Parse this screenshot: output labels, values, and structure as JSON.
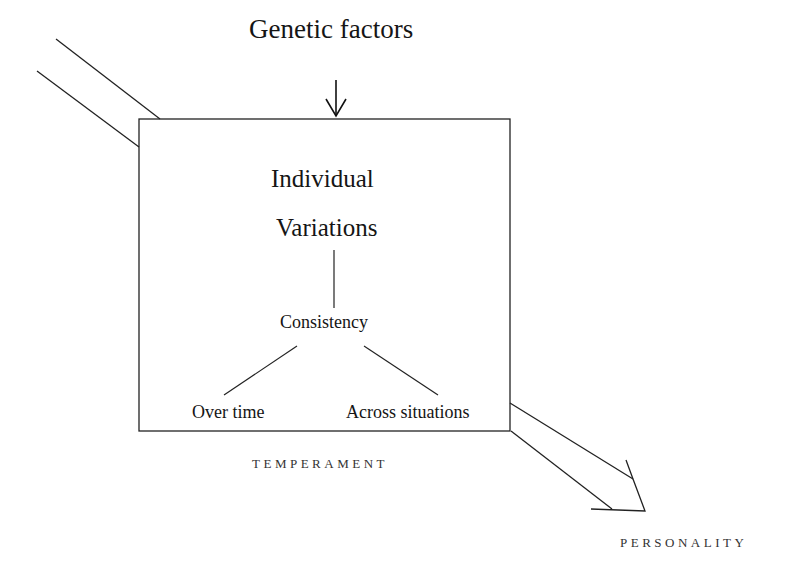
{
  "diagram": {
    "input_label": "Genetic factors",
    "box": {
      "title_line1": "Individual",
      "title_line2": "Variations",
      "child": "Consistency",
      "leaves": [
        "Over time",
        "Across situations"
      ],
      "caption": "TEMPERAMENT"
    },
    "output_label": "PERSONALITY",
    "colors": {
      "stroke": "#222222",
      "background": "#ffffff"
    }
  }
}
